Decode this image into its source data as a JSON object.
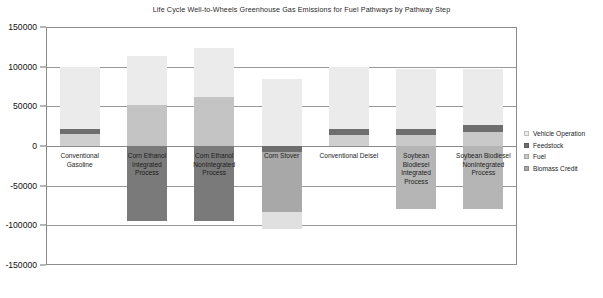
{
  "chart_data": {
    "type": "bar",
    "title": "Life Cycle Well-to-Wheels Greenhouse Gas Emissions for Fuel Pathways by Pathway Step",
    "xlabel": "",
    "ylabel": "",
    "ylim": [
      -150000,
      150000
    ],
    "ytick_values": [
      150000,
      100000,
      50000,
      0,
      -50000,
      -100000,
      -150000
    ],
    "ytick_labels": [
      "150000",
      "100000",
      "50000",
      "0",
      "-50000",
      "-100000",
      "-150000"
    ],
    "grid": true,
    "stacked": true,
    "legend_position": "right",
    "categories": [
      "Conventional Gasoline",
      "Corn Ethanol Integrated Process",
      "Corn Ethanol NonIntegrated Process",
      "Corn Stover",
      "Conventional Deisel",
      "Soybean Biodiesel Integrated Process",
      "Soybean Biodiesel NonIntegrated Process"
    ],
    "category_label_lines": [
      [
        "Conventional",
        "Gasoline"
      ],
      [
        "Corn Ethanol",
        "Integrated",
        "Process"
      ],
      [
        "Corn Ethanol",
        "NonIntegrated",
        "Process"
      ],
      [
        "Corn Stover"
      ],
      [
        "Conventional Deisel"
      ],
      [
        "Soybean",
        "Biodiesel",
        "Integrated",
        "Process"
      ],
      [
        "Soybean Biodiesel",
        "NonIntegrated",
        "Process"
      ]
    ],
    "series": [
      {
        "name": "Vehicle Operation",
        "color": "#ebebeb",
        "values": [
          78000,
          62000,
          62000,
          62000,
          76000,
          75000,
          75000
        ]
      },
      {
        "name": "Feedstock",
        "color": "#6e6e6e",
        "values": [
          7000,
          0,
          0,
          -8000,
          7000,
          8000,
          8000
        ]
      },
      {
        "name": "Fuel",
        "color": "#bdbdbd",
        "values": [
          15000,
          52000,
          62000,
          31000,
          18000,
          14000,
          18000
        ]
      },
      {
        "name": "Biomass Credit",
        "color": "#7a7a7a",
        "values": [
          0,
          -95000,
          -95000,
          -105000,
          0,
          -80000,
          -80000
        ]
      }
    ],
    "bar_segments": [
      {
        "category": "Conventional Gasoline",
        "segments": [
          {
            "series": "Fuel",
            "start": 0,
            "end": 15000,
            "color": "#cfcfcf"
          },
          {
            "series": "Feedstock",
            "start": 15000,
            "end": 22000,
            "color": "#6e6e6e"
          },
          {
            "series": "Vehicle Operation",
            "start": 22000,
            "end": 100000,
            "color": "#ebebeb"
          }
        ]
      },
      {
        "category": "Corn Ethanol Integrated Process",
        "segments": [
          {
            "series": "Fuel",
            "start": 0,
            "end": 52000,
            "color": "#c4c4c4"
          },
          {
            "series": "Vehicle Operation",
            "start": 52000,
            "end": 114000,
            "color": "#ebebeb"
          },
          {
            "series": "Biomass Credit",
            "start": -95000,
            "end": 0,
            "color": "#7a7a7a"
          }
        ]
      },
      {
        "category": "Corn Ethanol NonIntegrated Process",
        "segments": [
          {
            "series": "Fuel",
            "start": 0,
            "end": 62000,
            "color": "#c4c4c4"
          },
          {
            "series": "Vehicle Operation",
            "start": 62000,
            "end": 124000,
            "color": "#ebebeb"
          },
          {
            "series": "Biomass Credit",
            "start": -95000,
            "end": 0,
            "color": "#7a7a7a"
          }
        ]
      },
      {
        "category": "Corn Stover",
        "segments": [
          {
            "series": "Fuel",
            "start": 0,
            "end": 23000,
            "color": "#ebebeb"
          },
          {
            "series": "Feedstock",
            "start": -8000,
            "end": 0,
            "color": "#6e6e6e"
          },
          {
            "series": "Vehicle Operation",
            "start": 23000,
            "end": 85000,
            "color": "#ebebeb"
          },
          {
            "series": "Biomass Credit",
            "start": -83000,
            "end": -8000,
            "color": "#a8a8a8"
          },
          {
            "series": "Biomass Credit",
            "start": -105000,
            "end": -83000,
            "color": "#e0e0e0"
          }
        ]
      },
      {
        "category": "Conventional Deisel",
        "segments": [
          {
            "series": "Fuel",
            "start": 0,
            "end": 14000,
            "color": "#cfcfcf"
          },
          {
            "series": "Feedstock",
            "start": 14000,
            "end": 22000,
            "color": "#6e6e6e"
          },
          {
            "series": "Vehicle Operation",
            "start": 22000,
            "end": 100000,
            "color": "#ebebeb"
          }
        ]
      },
      {
        "category": "Soybean Biodiesel Integrated Process",
        "segments": [
          {
            "series": "Fuel",
            "start": 0,
            "end": 14000,
            "color": "#c9c9c9"
          },
          {
            "series": "Feedstock",
            "start": 14000,
            "end": 22000,
            "color": "#6e6e6e"
          },
          {
            "series": "Vehicle Operation",
            "start": 22000,
            "end": 97000,
            "color": "#ebebeb"
          },
          {
            "series": "Biomass Credit",
            "start": -80000,
            "end": 0,
            "color": "#b5b5b5"
          }
        ]
      },
      {
        "category": "Soybean Biodiesel NonIntegrated Process",
        "segments": [
          {
            "series": "Fuel",
            "start": 0,
            "end": 18000,
            "color": "#c9c9c9"
          },
          {
            "series": "Feedstock",
            "start": 18000,
            "end": 26000,
            "color": "#6e6e6e"
          },
          {
            "series": "Vehicle Operation",
            "start": 26000,
            "end": 97000,
            "color": "#ebebeb"
          },
          {
            "series": "Biomass Credit",
            "start": -80000,
            "end": 0,
            "color": "#b5b5b5"
          }
        ]
      }
    ],
    "legend": [
      {
        "label": "Vehicle Operation",
        "color": "#ebebeb"
      },
      {
        "label": "Feedstock",
        "color": "#6e6e6e"
      },
      {
        "label": "Fuel",
        "color": "#c9c9c9"
      },
      {
        "label": "Biomass Credit",
        "color": "#a8a8a8"
      }
    ]
  }
}
